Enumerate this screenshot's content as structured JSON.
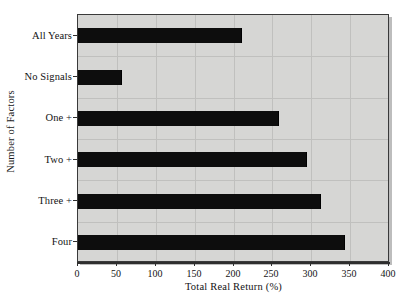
{
  "chart_data": {
    "type": "bar",
    "orientation": "horizontal",
    "title": "",
    "xlabel": "Total Real Return (%)",
    "ylabel": "Number of Factors",
    "categories": [
      "All Years",
      "No Signals",
      "One +",
      "Two +",
      "Three +",
      "Four"
    ],
    "values": [
      211,
      57,
      258,
      295,
      313,
      343
    ],
    "xlim": [
      0,
      400
    ],
    "xticks": [
      0,
      50,
      100,
      150,
      200,
      250,
      300,
      350,
      400
    ],
    "xtick_labels": [
      "0",
      "50",
      "100",
      "150",
      "200",
      "250",
      "300",
      "350",
      "400"
    ],
    "grid": true,
    "legend": null,
    "series": [
      {
        "name": "Total Real Return (%)",
        "values": [
          211,
          57,
          258,
          295,
          313,
          343
        ]
      }
    ],
    "colors": {
      "bar": "#0d0d0d",
      "plot_background": "#d6d6d4",
      "gridline": "#c0c0be",
      "axis": "#2e2e2e",
      "text": "#131313",
      "figure_background": "#ffffff"
    }
  }
}
